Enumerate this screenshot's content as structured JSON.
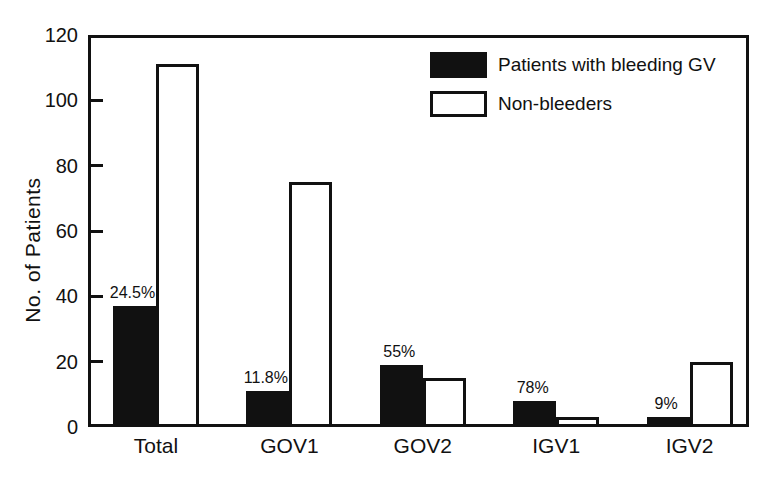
{
  "figure": {
    "background": "#ffffff",
    "ink_color": "#111111"
  },
  "legend": {
    "items": [
      {
        "label": "Patients with bleeding GV",
        "swatch": "filled-black"
      },
      {
        "label": "Non-bleeders",
        "swatch": "white-outlined"
      }
    ]
  },
  "chart_data": {
    "type": "bar",
    "title": "",
    "xlabel": "",
    "ylabel": "No. of Patients",
    "ylim": [
      0,
      120
    ],
    "yticks": [
      0,
      20,
      40,
      60,
      80,
      100,
      120
    ],
    "grid": false,
    "legend_position": "top-right",
    "categories": [
      "Total",
      "GOV1",
      "GOV2",
      "IGV1",
      "IGV2"
    ],
    "series": [
      {
        "name": "Patients with bleeding GV",
        "color": "#111111",
        "values": [
          37,
          11,
          19,
          8,
          3
        ]
      },
      {
        "name": "Non-bleeders",
        "color": "#ffffff",
        "values": [
          111,
          75,
          15,
          3,
          20
        ]
      }
    ],
    "bar_labels": {
      "on_series": "Patients with bleeding GV",
      "values": [
        "24.5%",
        "11.8%",
        "55%",
        "78%",
        "9%"
      ]
    }
  }
}
